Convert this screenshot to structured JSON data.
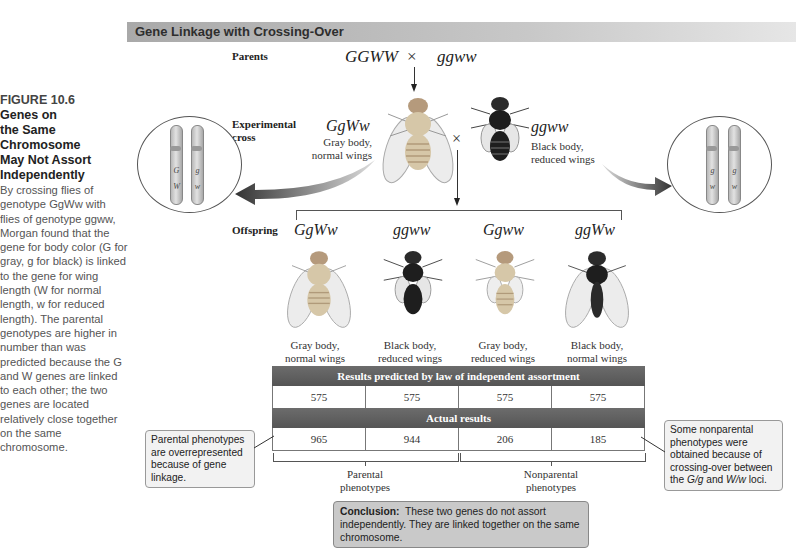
{
  "caption": {
    "figure_number": "FIGURE 10.6",
    "title_lines": [
      "Genes on",
      "the Same",
      "Chromosome",
      "May Not Assort",
      "Independently"
    ],
    "body": "By crossing flies of genotype GgWw with flies of genotype ggww, Morgan found that the gene for body color (G for gray, g for black) is linked to the gene for wing length (W for normal length, w for reduced length). The parental genotypes are higher in number than was predicted because the G and W genes are linked to each other; the two genes are located relatively close together on the same chromosome."
  },
  "header": {
    "title": "Gene Linkage with Crossing-Over"
  },
  "parents": {
    "label": "Parents",
    "genotype_left": "GGWW",
    "cross_symbol": "×",
    "genotype_right": "ggww"
  },
  "experimental_cross": {
    "label_line1": "Experimental",
    "label_line2": "cross",
    "cross_symbol": "×",
    "left_fly": {
      "genotype": "GgWw",
      "phenotype_line1": "Gray body,",
      "phenotype_line2": "normal wings",
      "body_color": "gray"
    },
    "right_fly": {
      "genotype": "ggww",
      "phenotype_line1": "Black body,",
      "phenotype_line2": "reduced wings",
      "body_color": "black"
    },
    "left_chromosomes": [
      {
        "upper": "G",
        "lower": "W"
      },
      {
        "upper": "g",
        "lower": "w"
      }
    ],
    "right_chromosomes": [
      {
        "upper": "g",
        "lower": "w"
      },
      {
        "upper": "g",
        "lower": "w"
      }
    ]
  },
  "offspring": {
    "label": "Offspring",
    "items": [
      {
        "genotype": "GgWw",
        "phenotype_line1": "Gray body,",
        "phenotype_line2": "normal wings"
      },
      {
        "genotype": "ggww",
        "phenotype_line1": "Black body,",
        "phenotype_line2": "reduced wings"
      },
      {
        "genotype": "Ggww",
        "phenotype_line1": "Gray body,",
        "phenotype_line2": "reduced wings"
      },
      {
        "genotype": "ggWw",
        "phenotype_line1": "Black body,",
        "phenotype_line2": "normal wings"
      }
    ]
  },
  "results_table": {
    "predicted_header": "Results predicted by law of independent assortment",
    "predicted": [
      "575",
      "575",
      "575",
      "575"
    ],
    "actual_header": "Actual results",
    "actual": [
      "965",
      "944",
      "206",
      "185"
    ]
  },
  "brackets": {
    "parental_line1": "Parental",
    "parental_line2": "phenotypes",
    "nonparental_line1": "Nonparental",
    "nonparental_line2": "phenotypes"
  },
  "callouts": {
    "left": "Parental phenotypes are overrepresented because of gene linkage.",
    "right_prefix": "Some nonparental phenotypes were obtained because of crossing-over between the ",
    "right_locus1": "G/g",
    "right_mid": " and ",
    "right_locus2": "W/w",
    "right_suffix": " loci."
  },
  "conclusion": {
    "label": "Conclusion:",
    "text": "These two genes do not assort independently. They are linked together on the same chromosome."
  },
  "colors": {
    "header_bar": "#b5b5b5",
    "table_header": "#5e5e5e",
    "conclusion_bg": "#c9c9c9",
    "callout_bg": "#f2f2f2",
    "gray_fly_body": "#d6c7a8",
    "black_fly_body": "#1e1e1e"
  }
}
